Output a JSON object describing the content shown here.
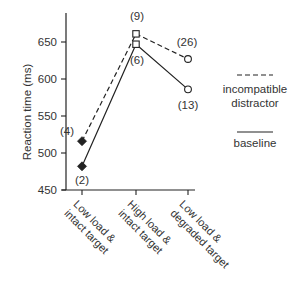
{
  "chart_data": {
    "type": "line",
    "title": "",
    "xlabel": "",
    "ylabel": "Reaction time (ms)",
    "ylim": [
      450,
      700
    ],
    "yticks": [
      450,
      500,
      550,
      600,
      650
    ],
    "grid": false,
    "legend_position": "right",
    "categories": [
      "Low load & intact target",
      "High load & intact target",
      "Low load & degraded target"
    ],
    "category_lines": [
      [
        "Low load &",
        "intact target"
      ],
      [
        "High load &",
        "intact target"
      ],
      [
        "Low load &",
        "degraded target"
      ]
    ],
    "series": [
      {
        "name": "incompatible distractor",
        "legend_lines": [
          "incompatible",
          "distractor"
        ],
        "line_style": "dashed",
        "values": [
          516,
          661,
          627
        ],
        "markers": [
          "diamond-filled",
          "square-open",
          "circle-open"
        ],
        "annotations": [
          "(4)",
          "(9)",
          "(26)"
        ]
      },
      {
        "name": "baseline",
        "legend_lines": [
          "baseline"
        ],
        "line_style": "solid",
        "values": [
          482,
          647,
          586
        ],
        "markers": [
          "diamond-filled",
          "square-open",
          "circle-open"
        ],
        "annotations": [
          "(2)",
          "(6)",
          "(13)"
        ]
      }
    ]
  },
  "colors": {
    "line": "#222222",
    "text": "#333333",
    "background": "#ffffff"
  }
}
